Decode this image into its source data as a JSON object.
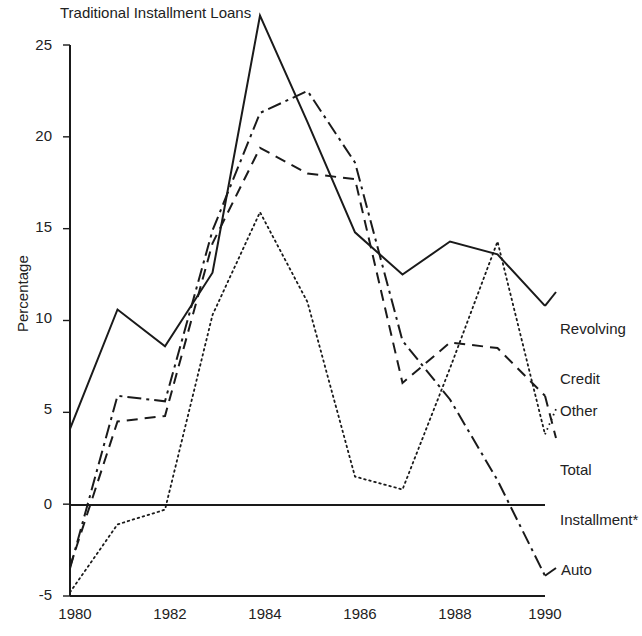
{
  "chart_data": {
    "type": "line",
    "title": "Traditional Installment Loans",
    "xlabel": "",
    "ylabel": "Percentage",
    "x": [
      1980,
      1981,
      1982,
      1983,
      1984,
      1985,
      1986,
      1987,
      1988,
      1989,
      1990
    ],
    "xlim": [
      1980,
      1990
    ],
    "ylim": [
      -5,
      25
    ],
    "xticks": [
      "1980",
      "1982",
      "1984",
      "1986",
      "1988",
      "1990"
    ],
    "yticks": [
      "25",
      "20",
      "15",
      "10",
      "5",
      "0",
      "-5"
    ],
    "grid": false,
    "legend": "inline-right-labels",
    "zero_line": true,
    "series": [
      {
        "name": "Revolving Credit",
        "style": "solid",
        "label_lines": [
          "Revolving",
          "Credit"
        ],
        "values": [
          4.1,
          10.6,
          8.6,
          12.6,
          26.6,
          20.8,
          14.8,
          12.5,
          14.3,
          13.6,
          10.8
        ]
      },
      {
        "name": "Total Installment*",
        "style": "dashed",
        "label_lines": [
          "Total",
          "Installment*"
        ],
        "values": [
          -3.4,
          4.5,
          4.8,
          14.2,
          19.4,
          18.0,
          17.7,
          6.6,
          8.8,
          8.5,
          5.9
        ]
      },
      {
        "name": "Other",
        "style": "dotted",
        "label_lines": [
          "Other"
        ],
        "values": [
          -4.8,
          -1.1,
          -0.3,
          10.3,
          15.9,
          11.0,
          1.5,
          0.8,
          7.4,
          14.3,
          3.8
        ]
      },
      {
        "name": "Auto",
        "style": "dash-dot",
        "label_lines": [
          "Auto"
        ],
        "values": [
          -3.5,
          5.9,
          5.6,
          14.9,
          21.3,
          22.5,
          18.6,
          8.9,
          5.7,
          1.3,
          -3.9
        ]
      }
    ]
  },
  "axes": {
    "y_label": "Percentage",
    "y_tick_values": [
      25,
      20,
      15,
      10,
      5,
      0,
      -5
    ],
    "x_tick_values": [
      1980,
      1982,
      1984,
      1986,
      1988,
      1990
    ]
  },
  "labels": {
    "title": "Traditional Installment Loans",
    "revolving_credit_l1": "Revolving",
    "revolving_credit_l2": "Credit",
    "other": "Other",
    "total_installment_l1": "Total",
    "total_installment_l2": "Installment*",
    "auto": "Auto",
    "y25": "25",
    "y20": "20",
    "y15": "15",
    "y10": "10",
    "y5": "5",
    "y0": "0",
    "ym5": "-5",
    "x1980": "1980",
    "x1982": "1982",
    "x1984": "1984",
    "x1986": "1986",
    "x1988": "1988",
    "x1990": "1990"
  },
  "colors": {
    "ink": "#1a1a1a",
    "background": "#ffffff"
  }
}
